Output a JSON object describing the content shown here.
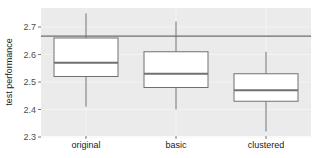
{
  "chart_data": {
    "type": "box",
    "title": "",
    "xlabel": "",
    "ylabel": "test performance",
    "ylim": [
      2.29,
      2.78
    ],
    "yticks": [
      2.3,
      2.4,
      2.5,
      2.6,
      2.7
    ],
    "ytick_labels": [
      "2.3",
      "2.4",
      "2.5",
      "2.6",
      "2.7"
    ],
    "categories": [
      "original",
      "basic",
      "clustered"
    ],
    "boxes": [
      {
        "name": "original",
        "whisker_low": 2.41,
        "q1": 2.52,
        "median": 2.57,
        "q3": 2.66,
        "whisker_high": 2.75
      },
      {
        "name": "basic",
        "whisker_low": 2.4,
        "q1": 2.48,
        "median": 2.53,
        "q3": 2.61,
        "whisker_high": 2.72
      },
      {
        "name": "clustered",
        "whisker_low": 2.32,
        "q1": 2.43,
        "median": 2.47,
        "q3": 2.53,
        "whisker_high": 2.61
      }
    ],
    "reference_line": {
      "y": 2.667,
      "orientation": "horizontal"
    },
    "grid": true,
    "legend": null
  },
  "style": {
    "panel_bg": "#ebebeb",
    "grid_color": "#f4f4f4",
    "line_color": "#707070",
    "box_fill": "#ffffff",
    "ref_line_color": "#6e6e6e"
  }
}
